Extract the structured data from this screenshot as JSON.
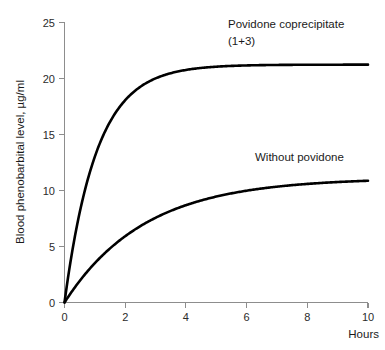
{
  "chart_data": {
    "type": "line",
    "title": "",
    "xlabel": "Hours",
    "ylabel": "Blood phenobarbital level, µg/ml",
    "xlim": [
      0,
      10
    ],
    "ylim": [
      0,
      25
    ],
    "xticks": [
      0,
      2,
      4,
      6,
      8,
      10
    ],
    "xtick_labels": [
      "0",
      "2",
      "4",
      "6",
      "8",
      "10"
    ],
    "yticks": [
      0,
      5,
      10,
      15,
      20,
      25
    ],
    "ytick_labels": [
      "0",
      "5",
      "10",
      "15",
      "20",
      "25"
    ],
    "grid": false,
    "legend": "inline-annotations",
    "x": [
      0,
      0.25,
      0.5,
      0.75,
      1,
      1.5,
      2,
      2.5,
      3,
      3.5,
      4,
      5,
      6,
      7,
      8,
      9,
      10
    ],
    "series": [
      {
        "name": "Povidone coprecipitate (1+3)",
        "annotation_lines": [
          "Povidone coprecipitate",
          "(1+3)"
        ],
        "plateau": 21.2,
        "rate": 0.95,
        "color": "#000000",
        "values": [
          0,
          4.5,
          8.2,
          11.1,
          13.0,
          16.1,
          18.0,
          19.2,
          19.9,
          20.4,
          20.7,
          21.0,
          21.1,
          21.2,
          21.2,
          21.2,
          21.2
        ]
      },
      {
        "name": "Without povidone",
        "annotation_lines": [
          "Without povidone"
        ],
        "plateau": 11.1,
        "rate": 0.38,
        "color": "#000000",
        "values": [
          0,
          1.0,
          1.9,
          2.7,
          3.5,
          4.8,
          5.9,
          6.8,
          7.6,
          8.2,
          8.7,
          9.5,
          10.0,
          10.4,
          10.6,
          10.8,
          11.0
        ]
      }
    ]
  },
  "axes": {
    "y_title": "Blood phenobarbital level, µg/ml",
    "x_title": "Hours"
  },
  "annotations": {
    "upper_line1": "Povidone coprecipitate",
    "upper_line2": "(1+3)",
    "lower_line1": "Without povidone"
  },
  "ticks": {
    "y": [
      "25",
      "20",
      "15",
      "10",
      "5",
      "0"
    ],
    "x": [
      "0",
      "2",
      "4",
      "6",
      "8",
      "10"
    ]
  },
  "colors": {
    "curve": "#000000",
    "axis": "#8d8d8d",
    "text": "#1a1a1a",
    "background": "#ffffff"
  }
}
